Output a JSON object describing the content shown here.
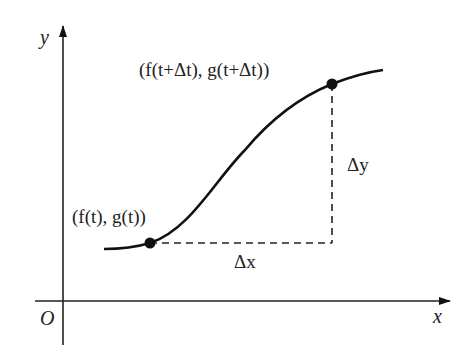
{
  "diagram": {
    "axes": {
      "x_label": "x",
      "y_label": "y",
      "origin_label": "O"
    },
    "points": [
      {
        "id": "p1",
        "label": "(f(t), g(t))"
      },
      {
        "id": "p2",
        "label": "(f(t+Δt), g(t+Δt))"
      }
    ],
    "increments": {
      "dx_label": "Δx",
      "dy_label": "Δy"
    },
    "colors": {
      "stroke": "#111111",
      "background": "#ffffff"
    }
  }
}
